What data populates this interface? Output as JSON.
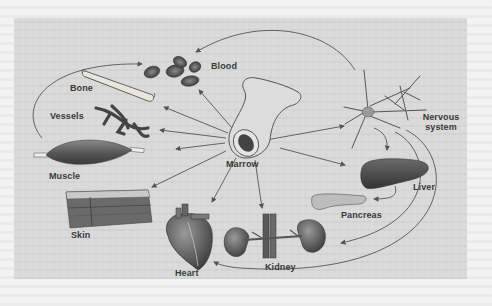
{
  "diagram": {
    "center": {
      "id": "marrow",
      "label": "Marrow",
      "icon": "bone-cross-section-icon"
    },
    "nodes": [
      {
        "id": "blood",
        "label": "Blood",
        "icon": "red-blood-cells-icon"
      },
      {
        "id": "bone",
        "label": "Bone",
        "icon": "bone-icon"
      },
      {
        "id": "vessels",
        "label": "Vessels",
        "icon": "blood-vessels-icon"
      },
      {
        "id": "muscle",
        "label": "Muscle",
        "icon": "muscle-icon"
      },
      {
        "id": "skin",
        "label": "Skin",
        "icon": "skin-layers-icon"
      },
      {
        "id": "heart",
        "label": "Heart",
        "icon": "heart-icon"
      },
      {
        "id": "kidney",
        "label": "Kidney",
        "icon": "kidney-icon"
      },
      {
        "id": "pancreas",
        "label": "Pancreas",
        "icon": "pancreas-icon"
      },
      {
        "id": "liver",
        "label": "Liver",
        "icon": "liver-icon"
      },
      {
        "id": "nervous",
        "label_line1": "Nervous",
        "label_line2": "system",
        "icon": "neuron-icon"
      }
    ],
    "edges": [
      {
        "from": "marrow",
        "to": "blood"
      },
      {
        "from": "marrow",
        "to": "bone"
      },
      {
        "from": "marrow",
        "to": "vessels"
      },
      {
        "from": "marrow",
        "to": "muscle"
      },
      {
        "from": "marrow",
        "to": "skin"
      },
      {
        "from": "marrow",
        "to": "heart"
      },
      {
        "from": "marrow",
        "to": "kidney"
      },
      {
        "from": "marrow",
        "to": "liver"
      },
      {
        "from": "marrow",
        "to": "nervous"
      },
      {
        "from": "nervous",
        "to": "blood"
      },
      {
        "from": "muscle",
        "to": "blood"
      },
      {
        "from": "nervous",
        "to": "liver"
      },
      {
        "from": "liver",
        "to": "pancreas"
      },
      {
        "from": "nervous",
        "to": "kidney"
      },
      {
        "from": "nervous",
        "to": "heart"
      }
    ],
    "colors": {
      "panel_bg": "#d9d9d9",
      "line": "#555555",
      "organ_dark": "#4a4a4a",
      "organ_mid": "#7a7a7a",
      "organ_light": "#b5b5b5",
      "label": "#3a3a3a"
    }
  }
}
